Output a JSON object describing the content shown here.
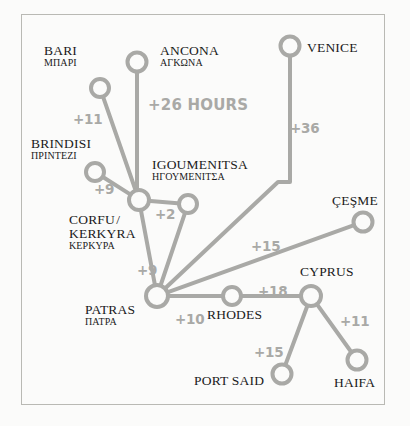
{
  "diagram": {
    "colors": {
      "line": "#a9a9a6",
      "node_stroke": "#a9a9a6",
      "node_fill": "#fbfbfa",
      "label_text": "#1a1a1a",
      "weight_text": "#a9a9a6",
      "frame": "#b9b9b4",
      "background": "#fbfbfa"
    },
    "frame": {
      "x": 21,
      "y": 14,
      "width": 364,
      "height": 391
    },
    "nodes": [
      {
        "id": "bari",
        "name": "BARI",
        "greek": "ΜΠΑΡΙ",
        "cx": 100,
        "cy": 88,
        "r": 9,
        "label_x": 44,
        "label_y": 44,
        "align": "left"
      },
      {
        "id": "ancona",
        "name": "ANCONA",
        "greek": "ΑΓΚΩΝΑ",
        "cx": 137,
        "cy": 62,
        "r": 9.5,
        "label_x": 160,
        "label_y": 44,
        "align": "left"
      },
      {
        "id": "venice",
        "name": "VENICE",
        "greek": "",
        "cx": 290,
        "cy": 46,
        "r": 9.5,
        "label_x": 307,
        "label_y": 41,
        "align": "left"
      },
      {
        "id": "brindisi",
        "name": "BRINDISI",
        "greek": "ΠΡΙΝΤΕΖΙ",
        "cx": 95,
        "cy": 172,
        "r": 9,
        "label_x": 31,
        "label_y": 137,
        "align": "left"
      },
      {
        "id": "corfu",
        "name": "CORFU /\nKERKYRA",
        "greek": "ΚΕΡΚΥΡΑ",
        "cx": 139,
        "cy": 200,
        "r": 10,
        "label_x": 69,
        "label_y": 213,
        "align": "left"
      },
      {
        "id": "igoumenitsa",
        "name": "IGOUMENITSA",
        "greek": "ΗΓΟΥΜΕΝΙΤΣΑ",
        "cx": 188,
        "cy": 204,
        "r": 9,
        "label_x": 152,
        "label_y": 158,
        "align": "left"
      },
      {
        "id": "cesme",
        "name": "ÇEŞME",
        "greek": "",
        "cx": 363,
        "cy": 222,
        "r": 9.5,
        "label_x": 332,
        "label_y": 194,
        "align": "left"
      },
      {
        "id": "patras",
        "name": "PATRAS",
        "greek": "ΠΑΤΡΑ",
        "cx": 157,
        "cy": 296,
        "r": 11,
        "label_x": 85,
        "label_y": 303,
        "align": "left"
      },
      {
        "id": "rhodes",
        "name": "RHODES",
        "greek": "",
        "cx": 232,
        "cy": 296,
        "r": 9,
        "label_x": 207,
        "label_y": 308,
        "align": "left"
      },
      {
        "id": "cyprus",
        "name": "CYPRUS",
        "greek": "",
        "cx": 311,
        "cy": 296,
        "r": 10,
        "label_x": 300,
        "label_y": 265,
        "align": "left"
      },
      {
        "id": "port_said",
        "name": "PORT SAID",
        "greek": "",
        "cx": 282,
        "cy": 374,
        "r": 9.5,
        "label_x": 194,
        "label_y": 374,
        "align": "left"
      },
      {
        "id": "haifa",
        "name": "HAIFA",
        "greek": "",
        "cx": 357,
        "cy": 360,
        "r": 9.5,
        "label_x": 334,
        "label_y": 376,
        "align": "left"
      }
    ],
    "edges": [
      {
        "id": "bari-corfu",
        "from": "bari",
        "to": "corfu",
        "weight": "+11",
        "weight_x": 73,
        "weight_y": 111
      },
      {
        "id": "ancona-corfu",
        "from": "ancona",
        "to": "corfu",
        "weight": "+26 HOURS",
        "weight_x": 148,
        "weight_y": 96,
        "big": true
      },
      {
        "id": "brindisi-corfu",
        "from": "brindisi",
        "to": "corfu",
        "weight": "+9",
        "weight_x": 94,
        "weight_y": 181
      },
      {
        "id": "corfu-igoumenitsa",
        "from": "corfu",
        "to": "igoumenitsa",
        "weight": "+2",
        "weight_x": 155,
        "weight_y": 206
      },
      {
        "id": "igoumenitsa-patras",
        "from": "igoumenitsa",
        "to": "patras",
        "weight": "",
        "weight_x": 0,
        "weight_y": 0
      },
      {
        "id": "venice-patras",
        "from": "venice",
        "to": "patras",
        "weight": "+36",
        "weight_x": 290,
        "weight_y": 120
      },
      {
        "id": "patras-corfu",
        "from": "patras",
        "to": "corfu",
        "weight": "+9",
        "weight_x": 137,
        "weight_y": 262
      },
      {
        "id": "patras-cesme",
        "from": "patras",
        "to": "cesme",
        "weight": "+15",
        "weight_x": 251,
        "weight_y": 238
      },
      {
        "id": "patras-rhodes",
        "from": "patras",
        "to": "rhodes",
        "weight": "+10",
        "weight_x": 175,
        "weight_y": 311
      },
      {
        "id": "rhodes-cyprus",
        "from": "rhodes",
        "to": "cyprus",
        "weight": "+18",
        "weight_x": 258,
        "weight_y": 283
      },
      {
        "id": "cyprus-port_said",
        "from": "cyprus",
        "to": "port_said",
        "weight": "+15",
        "weight_x": 254,
        "weight_y": 344
      },
      {
        "id": "cyprus-haifa",
        "from": "cyprus",
        "to": "haifa",
        "weight": "+11",
        "weight_x": 340,
        "weight_y": 313
      }
    ]
  },
  "chart_data": {
    "type": "diagram",
    "unit": "hours",
    "nodes": [
      "BARI",
      "ANCONA",
      "VENICE",
      "BRINDISI",
      "CORFU / KERKYRA",
      "IGOUMENITSA",
      "ÇEŞME",
      "PATRAS",
      "RHODES",
      "CYPRUS",
      "PORT SAID",
      "HAIFA"
    ],
    "links": [
      {
        "source": "BARI",
        "target": "CORFU / KERKYRA",
        "value": 11,
        "label": "+11"
      },
      {
        "source": "ANCONA",
        "target": "CORFU / KERKYRA",
        "value": 26,
        "label": "+26 HOURS"
      },
      {
        "source": "BRINDISI",
        "target": "CORFU / KERKYRA",
        "value": 9,
        "label": "+9"
      },
      {
        "source": "CORFU / KERKYRA",
        "target": "IGOUMENITSA",
        "value": 2,
        "label": "+2"
      },
      {
        "source": "CORFU / KERKYRA",
        "target": "PATRAS",
        "value": 9,
        "label": "+9"
      },
      {
        "source": "VENICE",
        "target": "PATRAS",
        "value": 36,
        "label": "+36"
      },
      {
        "source": "PATRAS",
        "target": "ÇEŞME",
        "value": 15,
        "label": "+15"
      },
      {
        "source": "PATRAS",
        "target": "RHODES",
        "value": 10,
        "label": "+10"
      },
      {
        "source": "RHODES",
        "target": "CYPRUS",
        "value": 18,
        "label": "+18"
      },
      {
        "source": "CYPRUS",
        "target": "PORT SAID",
        "value": 15,
        "label": "+15"
      },
      {
        "source": "CYPRUS",
        "target": "HAIFA",
        "value": 11,
        "label": "+11"
      }
    ]
  }
}
